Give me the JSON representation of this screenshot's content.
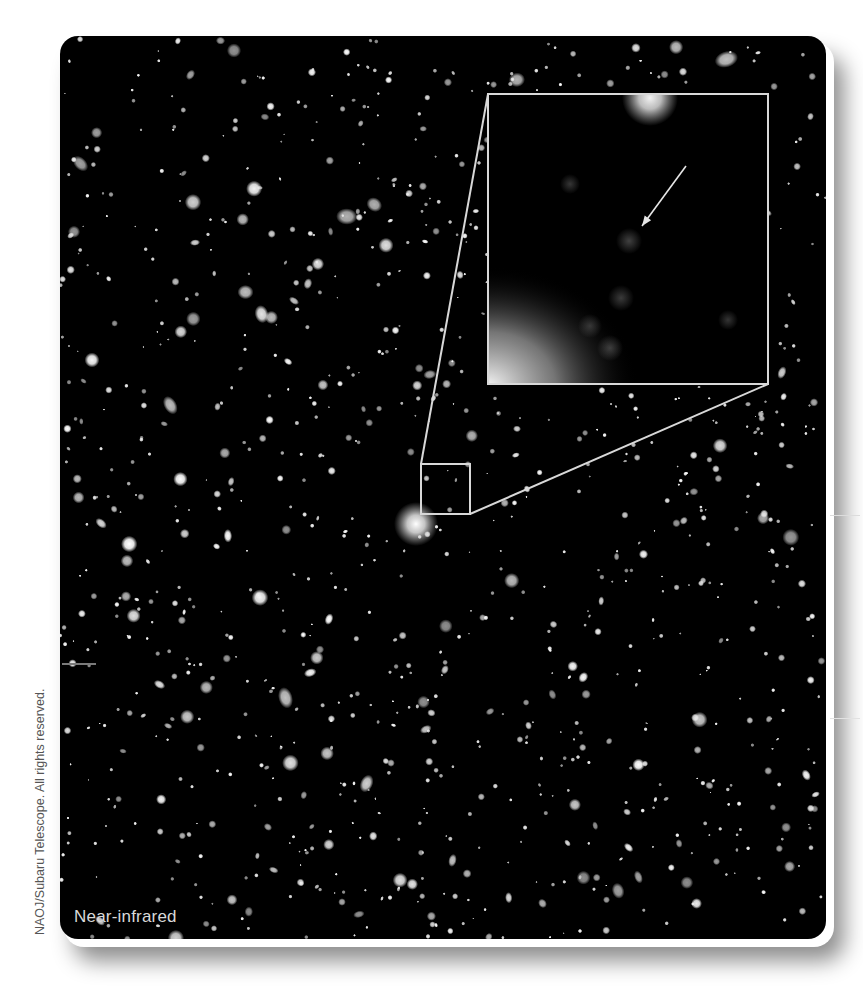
{
  "figure": {
    "label": "Near-infrared",
    "credit": "NAOJ/Subaru Telescope. All rights reserved.",
    "colors": {
      "background": "#000000",
      "frame_line": "#d8d8d8",
      "label_text": "#d9d9d9",
      "credit_text": "#555555",
      "arrow": "#e6e6e6"
    },
    "zoom_box": {
      "x": 361,
      "y": 428,
      "w": 49,
      "h": 50
    },
    "inset": {
      "x": 428,
      "y": 58,
      "w": 280,
      "h": 290
    },
    "inset_arrow": {
      "x1": 626,
      "y1": 130,
      "x2": 582,
      "y2": 190
    },
    "inset_blobs": [
      {
        "x": 510,
        "y": 148,
        "r": 10,
        "o": 0.35
      },
      {
        "x": 569,
        "y": 205,
        "r": 13,
        "o": 0.42
      },
      {
        "x": 561,
        "y": 262,
        "r": 13,
        "o": 0.38
      },
      {
        "x": 530,
        "y": 290,
        "r": 12,
        "o": 0.32
      },
      {
        "x": 550,
        "y": 312,
        "r": 13,
        "o": 0.38
      },
      {
        "x": 668,
        "y": 284,
        "r": 10,
        "o": 0.34
      },
      {
        "x": 590,
        "y": 62,
        "r": 28,
        "o": 0.95
      }
    ],
    "bright_galaxy": {
      "x": 356,
      "y": 488,
      "r": 22
    }
  }
}
